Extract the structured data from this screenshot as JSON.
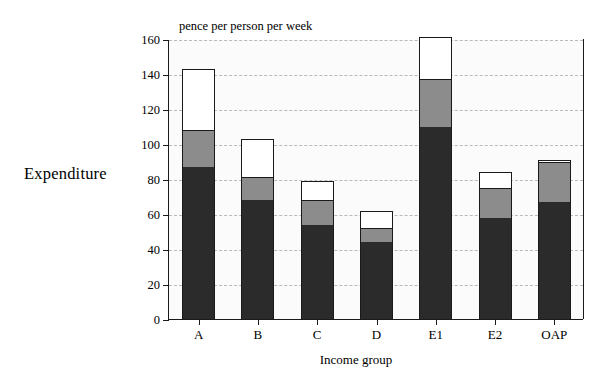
{
  "figure": {
    "y_axis_title": "Expenditure",
    "x_axis_title": "Income group",
    "units_label": "pence per person per week"
  },
  "chart_data": {
    "type": "bar",
    "stacked": true,
    "title": "",
    "subtitle": "",
    "xlabel": "Income group",
    "ylabel": "Expenditure",
    "units": "pence per person per week",
    "categories": [
      "A",
      "B",
      "C",
      "D",
      "E1",
      "E2",
      "OAP"
    ],
    "ylim": [
      0,
      160
    ],
    "ytick_values": [
      0,
      20,
      40,
      60,
      80,
      100,
      120,
      140,
      160
    ],
    "ytick_labels": [
      "0",
      "20",
      "40",
      "60",
      "80",
      "100",
      "120",
      "140",
      "160"
    ],
    "grid": true,
    "grid_axis": "y",
    "grid_style": "dashed",
    "legend": false,
    "legend_position": "none",
    "series": [
      {
        "name": "segment-dark",
        "color": "#2b2b2b",
        "values": [
          87,
          68,
          54,
          44,
          110,
          58,
          67
        ]
      },
      {
        "name": "segment-grey",
        "color": "#8c8c8c",
        "values": [
          21,
          13,
          14,
          8,
          27,
          17,
          23
        ]
      },
      {
        "name": "segment-white",
        "color": "#ffffff",
        "values": [
          35,
          22,
          11,
          10,
          24,
          9,
          1
        ]
      }
    ],
    "totals": [
      143,
      103,
      79,
      62,
      161,
      84,
      91
    ],
    "cumulative": [
      {
        "category": "A",
        "dark_top": 87,
        "grey_top": 108,
        "white_top": 143
      },
      {
        "category": "B",
        "dark_top": 68,
        "grey_top": 81,
        "white_top": 103
      },
      {
        "category": "C",
        "dark_top": 54,
        "grey_top": 68,
        "white_top": 79
      },
      {
        "category": "D",
        "dark_top": 44,
        "grey_top": 52,
        "white_top": 62
      },
      {
        "category": "E1",
        "dark_top": 110,
        "grey_top": 137,
        "white_top": 161
      },
      {
        "category": "E2",
        "dark_top": 58,
        "grey_top": 75,
        "white_top": 84
      },
      {
        "category": "OAP",
        "dark_top": 67,
        "grey_top": 90,
        "white_top": 91
      }
    ]
  },
  "colors": {
    "dark": "#2b2b2b",
    "grey": "#8c8c8c",
    "white": "#ffffff",
    "outline": "#1a1a1a",
    "gridline": "#b9b9b9",
    "plot_background": "#fbfbfb",
    "page_background": "#ffffff"
  }
}
